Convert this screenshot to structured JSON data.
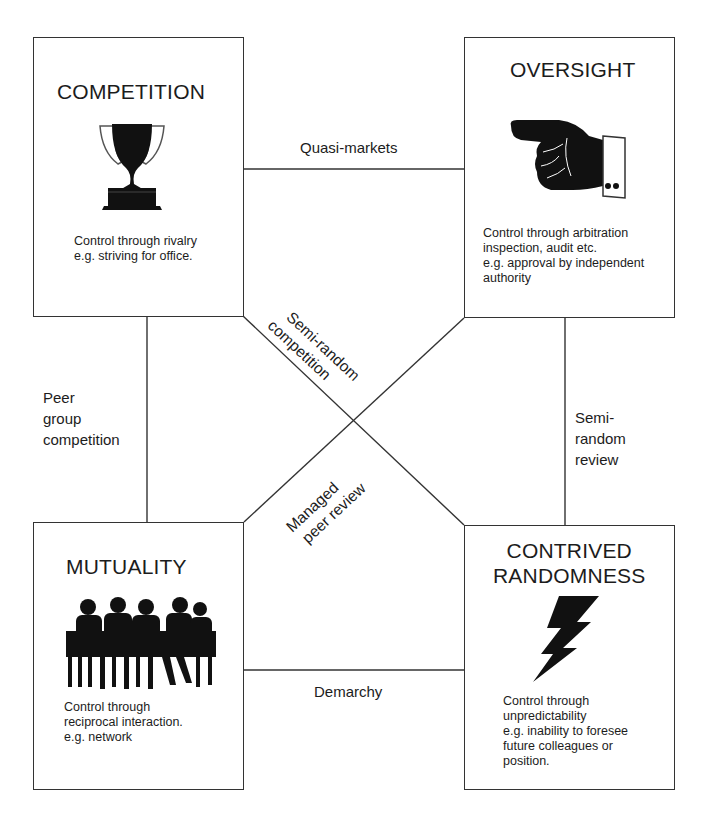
{
  "diagram": {
    "type": "control-mechanisms-quadrant",
    "boxes": {
      "competition": {
        "title": "COMPETITION",
        "icon": "trophy-icon",
        "description": [
          "Control through rivalry",
          "e.g. striving for office."
        ]
      },
      "oversight": {
        "title": "OVERSIGHT",
        "icon": "pointing-hand-icon",
        "description": [
          "Control through arbitration",
          "inspection, audit etc.",
          "e.g. approval by independent",
          "authority"
        ]
      },
      "mutuality": {
        "title": "MUTUALITY",
        "icon": "group-meeting-silhouette-icon",
        "description": [
          "Control through",
          "reciprocal interaction.",
          "e.g. network"
        ]
      },
      "contrived_randomness": {
        "title_lines": [
          "CONTRIVED",
          "RANDOMNESS"
        ],
        "icon": "lightning-bolt-icon",
        "description": [
          "Control through",
          "unpredictability",
          "e.g. inability to foresee",
          "future colleagues or",
          "position."
        ]
      }
    },
    "connections": {
      "top": "Quasi-markets",
      "left": [
        "Peer",
        "group",
        "competition"
      ],
      "right": [
        "Semi-",
        "random",
        "review"
      ],
      "bottom": "Demarchy",
      "diagonal_tl_br": [
        "Semi-random",
        "competition"
      ],
      "diagonal_bl_tr": [
        "Managed",
        "peer review"
      ]
    },
    "colors": {
      "line": "#333333",
      "text": "#1c1c1c",
      "background": "#ffffff",
      "icon": "#111111"
    }
  }
}
